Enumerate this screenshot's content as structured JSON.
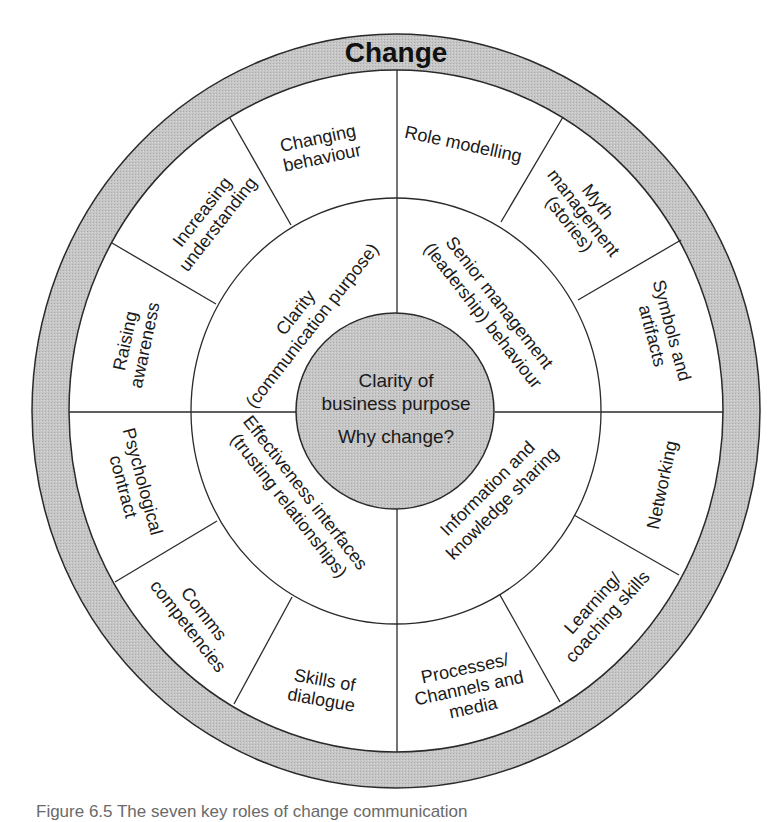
{
  "diagram": {
    "title": "Change",
    "center": {
      "line1": "Clarity of",
      "line2": "business purpose",
      "line3": "Why change?"
    },
    "middle_ring": [
      {
        "line1": "Clarity",
        "line2": "(communication purpose)"
      },
      {
        "line1": "Senior management",
        "line2": "(leadership) behaviour"
      },
      {
        "line1": "Information and",
        "line2": "knowledge sharing"
      },
      {
        "line1": "Effectiveness interfaces",
        "line2": "(trusting relationships)"
      }
    ],
    "outer_segments": [
      {
        "line1": "Changing",
        "line2": "behaviour"
      },
      {
        "line1": "Role modelling",
        "line2": ""
      },
      {
        "line1": "Myth",
        "line2": "management",
        "line3": "(stories)"
      },
      {
        "line1": "Symbols and",
        "line2": "artifacts"
      },
      {
        "line1": "Networking",
        "line2": ""
      },
      {
        "line1": "Learning/",
        "line2": "coaching skills"
      },
      {
        "line1": "Processes/",
        "line2": "Channels and",
        "line3": "media"
      },
      {
        "line1": "Skills of",
        "line2": "dialogue"
      },
      {
        "line1": "Comms",
        "line2": "competencies"
      },
      {
        "line1": "Psychological",
        "line2": "contract"
      },
      {
        "line1": "Raising",
        "line2": "awareness"
      },
      {
        "line1": "Increasing",
        "line2": "understanding"
      }
    ],
    "colors": {
      "ring_fill": "#c4c4c4",
      "center_fill": "#b8b8b8",
      "stroke": "#2a2a2a"
    }
  },
  "caption": "Figure 6.5 The seven key roles of change communication"
}
